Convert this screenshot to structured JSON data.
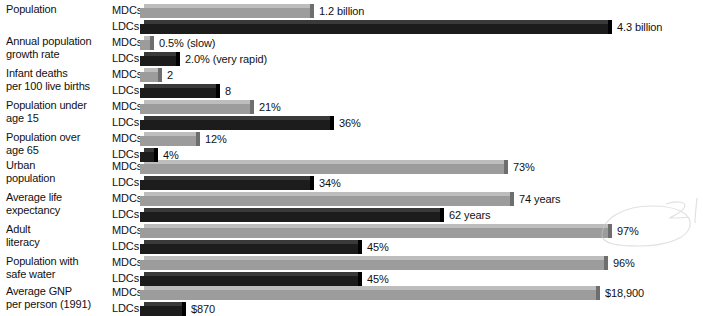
{
  "chart_data": {
    "type": "bar",
    "title": "",
    "subtitle": "",
    "xlabel": "",
    "ylabel": "",
    "grid": false,
    "legend_position": "inline-row-labels",
    "orientation": "horizontal",
    "series_names": [
      "MDCs",
      "LDCs"
    ],
    "group_label_mdc": "MDCs",
    "group_label_ldc": "LDCs",
    "categories": [
      "Population",
      "Annual population growth rate",
      "Infant deaths per 100 live births",
      "Population under age 15",
      "Population over age 65",
      "Urban population",
      "Average life expectancy",
      "Adult literacy",
      "Population with safe water",
      "Average GNP per person (1991)"
    ],
    "rows": [
      {
        "label_line1": "Population",
        "label_line2": "",
        "unit": "billion people",
        "mdc": {
          "series": "MDCs",
          "value": 1.2,
          "value_label": "1.2 billion",
          "bar_px": 170
        },
        "ldc": {
          "series": "LDCs",
          "value": 4.3,
          "value_label": "4.3 billion",
          "bar_px": 468
        }
      },
      {
        "label_line1": "Annual population",
        "label_line2": "growth rate",
        "unit": "percent per year",
        "mdc": {
          "series": "MDCs",
          "value": 0.5,
          "value_label": "0.5% (slow)",
          "bar_px": 10
        },
        "ldc": {
          "series": "LDCs",
          "value": 2.0,
          "value_label": "2.0% (very rapid)",
          "bar_px": 36
        }
      },
      {
        "label_line1": "Infant deaths",
        "label_line2": "per 100 live births",
        "unit": "deaths",
        "mdc": {
          "series": "MDCs",
          "value": 2,
          "value_label": "2",
          "bar_px": 18
        },
        "ldc": {
          "series": "LDCs",
          "value": 8,
          "value_label": "8",
          "bar_px": 76
        }
      },
      {
        "label_line1": "Population under",
        "label_line2": "age 15",
        "unit": "percent",
        "mdc": {
          "series": "MDCs",
          "value": 21,
          "value_label": "21%",
          "bar_px": 110
        },
        "ldc": {
          "series": "LDCs",
          "value": 36,
          "value_label": "36%",
          "bar_px": 190
        }
      },
      {
        "label_line1": "Population over",
        "label_line2": "age 65",
        "unit": "percent",
        "mdc": {
          "series": "MDCs",
          "value": 12,
          "value_label": "12%",
          "bar_px": 56
        },
        "ldc": {
          "series": "LDCs",
          "value": 4,
          "value_label": "4%",
          "bar_px": 14
        }
      },
      {
        "label_line1": "Urban",
        "label_line2": "population",
        "unit": "percent",
        "mdc": {
          "series": "MDCs",
          "value": 73,
          "value_label": "73%",
          "bar_px": 364
        },
        "ldc": {
          "series": "LDCs",
          "value": 34,
          "value_label": "34%",
          "bar_px": 170
        }
      },
      {
        "label_line1": "Average life",
        "label_line2": "expectancy",
        "unit": "years",
        "mdc": {
          "series": "MDCs",
          "value": 74,
          "value_label": "74 years",
          "bar_px": 370
        },
        "ldc": {
          "series": "LDCs",
          "value": 62,
          "value_label": "62 years",
          "bar_px": 300
        }
      },
      {
        "label_line1": "Adult",
        "label_line2": "literacy",
        "unit": "percent",
        "mdc": {
          "series": "MDCs",
          "value": 97,
          "value_label": "97%",
          "bar_px": 468
        },
        "ldc": {
          "series": "LDCs",
          "value": 45,
          "value_label": "45%",
          "bar_px": 218
        }
      },
      {
        "label_line1": "Population with",
        "label_line2": "safe water",
        "unit": "percent",
        "mdc": {
          "series": "MDCs",
          "value": 96,
          "value_label": "96%",
          "bar_px": 464
        },
        "ldc": {
          "series": "LDCs",
          "value": 45,
          "value_label": "45%",
          "bar_px": 218
        }
      },
      {
        "label_line1": "Average GNP",
        "label_line2": "per person (1991)",
        "unit": "US dollars",
        "mdc": {
          "series": "MDCs",
          "value": 18900,
          "value_label": "$18,900",
          "bar_px": 456
        },
        "ldc": {
          "series": "LDCs",
          "value": 870,
          "value_label": "$870",
          "bar_px": 42
        }
      }
    ],
    "colors": {
      "mdc_face": "#9c9c9c",
      "mdc_top": "#bdbdbd",
      "mdc_cap": "#6e6e6e",
      "ldc_face": "#1c1c1c",
      "ldc_top": "#3a3a3a",
      "ldc_cap": "#000000",
      "text": "#111111",
      "background": "#ffffff"
    },
    "annotation": {
      "type": "handwritten-scribble",
      "description": "faint pale-gray handwritten loop mark over right side near the 97% bar"
    }
  }
}
